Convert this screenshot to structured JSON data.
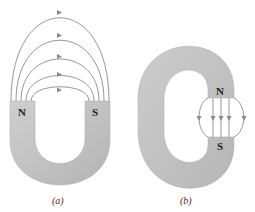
{
  "figure": {
    "panels": [
      {
        "id": "a",
        "caption": "(a)",
        "description": "Horseshoe magnet with open gap; field lines arc outside from N to S",
        "poles": {
          "north": "N",
          "south": "S"
        },
        "field_line_count": 5,
        "arrow_direction": "N to S (rightward at top)"
      },
      {
        "id": "b",
        "caption": "(b)",
        "description": "C-shaped magnet with narrow gap; field lines straight across gap from N to S with fringing",
        "poles": {
          "north": "N",
          "south": "S"
        },
        "field_line_count": 5,
        "arrow_direction": "downward (N to S)"
      }
    ],
    "colors": {
      "magnet_fill": "#c6c6c6",
      "magnet_shade": "#b3b3b3",
      "field_line": "#8a8a8a",
      "text": "#222222"
    }
  }
}
